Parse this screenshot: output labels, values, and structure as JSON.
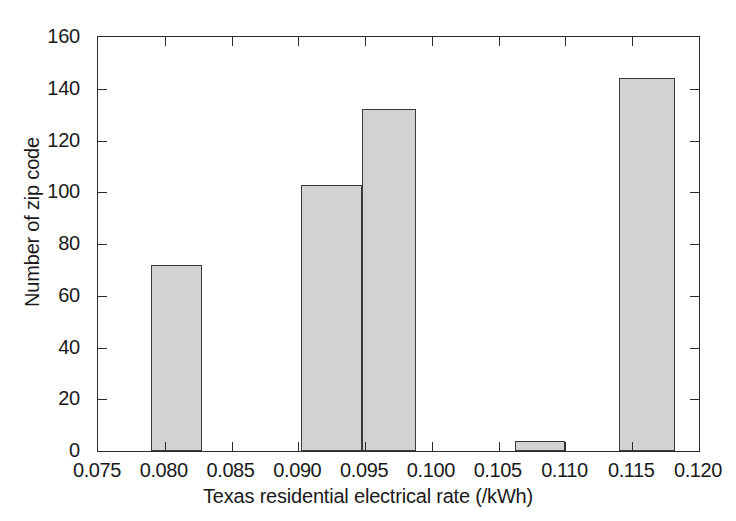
{
  "chart_data": {
    "type": "bar",
    "title": "",
    "subtitle": "",
    "xlabel": "Texas residential electrical rate (/kWh)",
    "ylabel": "Number of zip code",
    "xlim": [
      0.075,
      0.12
    ],
    "ylim": [
      0,
      160
    ],
    "grid": false,
    "legend": null,
    "xticks": [
      "0.075",
      "0.080",
      "0.085",
      "0.090",
      "0.095",
      "0.100",
      "0.105",
      "0.110",
      "0.115",
      "0.120"
    ],
    "xtick_values": [
      0.075,
      0.08,
      0.085,
      0.09,
      0.095,
      0.1,
      0.105,
      0.11,
      0.115,
      0.12
    ],
    "yticks": [
      "0",
      "20",
      "40",
      "60",
      "80",
      "100",
      "120",
      "140",
      "160"
    ],
    "ytick_values": [
      0,
      20,
      40,
      60,
      80,
      100,
      120,
      140,
      160
    ],
    "bar_fill_color": "#d2d2d2",
    "bar_edge_color": "#3a3a3a",
    "axis_color": "#2b2b2b",
    "background_color": "#ffffff",
    "bins": [
      {
        "label": "0.0790-0.0828",
        "x_start": 0.079,
        "x_end": 0.0828,
        "value": 72
      },
      {
        "label": "0.0902-0.0948",
        "x_start": 0.0902,
        "x_end": 0.0948,
        "value": 103
      },
      {
        "label": "0.0948-0.0988",
        "x_start": 0.0948,
        "x_end": 0.0988,
        "value": 132
      },
      {
        "label": "0.1062-0.1100",
        "x_start": 0.1062,
        "x_end": 0.11,
        "value": 4
      },
      {
        "label": "0.1140-0.1182",
        "x_start": 0.114,
        "x_end": 0.1182,
        "value": 144
      }
    ],
    "categories": [
      "0.0790-0.0828",
      "0.0902-0.0948",
      "0.0948-0.0988",
      "0.1062-0.1100",
      "0.1140-0.1182"
    ],
    "values": [
      72,
      103,
      132,
      4,
      144
    ]
  }
}
